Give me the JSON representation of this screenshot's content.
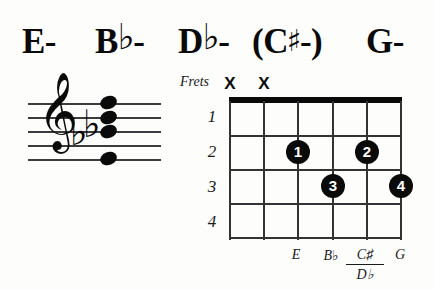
{
  "chord_names": [
    {
      "root": "E",
      "accidental": "",
      "quality": "-",
      "parenthesized": false,
      "x": 22
    },
    {
      "root": "B",
      "accidental": "♭",
      "quality": "-",
      "parenthesized": false,
      "x": 95
    },
    {
      "root": "D",
      "accidental": "♭",
      "quality": "-",
      "parenthesized": false,
      "x": 178
    },
    {
      "root": "C",
      "accidental": "♯",
      "quality": "-",
      "parenthesized": true,
      "x": 252
    },
    {
      "root": "G",
      "accidental": "",
      "quality": "-",
      "parenthesized": false,
      "x": 366
    }
  ],
  "staff": {
    "clef": "treble-clef",
    "clef_glyph": "𝄞",
    "key_signature_glyph": "♭",
    "key_signature_count": 2,
    "line_count": 5,
    "notehead_count": 4
  },
  "diagram": {
    "frets_label": "Frets",
    "fret_numbers": [
      "1",
      "2",
      "3",
      "4"
    ],
    "string_count": 6,
    "muted_markers": [
      "X",
      "X"
    ],
    "finger_positions": [
      {
        "finger": "1",
        "string": 3,
        "fret": 2
      },
      {
        "finger": "2",
        "string": 5,
        "fret": 2
      },
      {
        "finger": "3",
        "string": 4,
        "fret": 3
      },
      {
        "finger": "4",
        "string": 6,
        "fret": 3
      }
    ],
    "note_labels": [
      {
        "name": "E",
        "accidental": ""
      },
      {
        "name": "B",
        "accidental": "♭"
      },
      {
        "name": "C",
        "accidental": "♯",
        "alt_name": "D",
        "alt_accidental": "♭"
      },
      {
        "name": "G",
        "accidental": ""
      }
    ]
  },
  "colors": {
    "ink": "#0a0a0a",
    "line": "#333333",
    "staff_line": "#3c3c3c",
    "background": "#fdfdfc"
  }
}
